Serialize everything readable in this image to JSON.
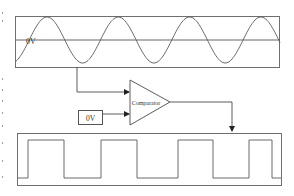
{
  "diagram": {
    "input_signal": {
      "type": "sine",
      "cycles": 3.75,
      "reference_label": "0V"
    },
    "comparator": {
      "label": "Comparator",
      "inputs": [
        "sine input",
        "reference"
      ]
    },
    "reference_source": {
      "label": "0V"
    },
    "output_signal": {
      "type": "square",
      "pulses": 4
    },
    "colors": {
      "lines": "#555555",
      "background": "#ffffff"
    }
  }
}
